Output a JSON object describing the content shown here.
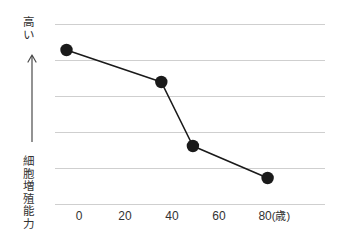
{
  "chart_data": {
    "type": "line",
    "title": "",
    "subtitle": "",
    "xlabel": "年齢",
    "ylabel": "細胞増殖能力",
    "x_unit": "（歳）",
    "y_axis_top_label": "高い",
    "y_axis_arrow": "up-arrow",
    "xlim": [
      -4,
      90
    ],
    "ylim": [
      0,
      6
    ],
    "xticks": [
      0,
      20,
      40,
      60,
      80
    ],
    "xticklabels": [
      "0",
      "20",
      "40",
      "60",
      "80"
    ],
    "xticklabel_last_suffix": "(歳)",
    "yticks": [
      0,
      1,
      2,
      3,
      4,
      5
    ],
    "yticklabels": [
      "",
      "",
      "",
      "",
      "",
      ""
    ],
    "grid": "horizontal",
    "legend": "none",
    "marker": "filled-circle",
    "series": [
      {
        "name": "細胞増殖能力",
        "x": [
          0,
          33,
          44,
          70
        ],
        "y": [
          5.0,
          4.0,
          2.0,
          1.0
        ],
        "color": "#1a1a1a"
      }
    ],
    "colors": {
      "line": "#1a1a1a",
      "marker": "#1a1a1a",
      "gridline": "#cfcfcf",
      "text": "#333333",
      "background": "#ffffff"
    }
  },
  "axes": {
    "y_caption_high": "高い",
    "y_caption_metric": "細胞増殖能力",
    "x_labels": [
      {
        "text": "0",
        "unit": ""
      },
      {
        "text": "20",
        "unit": ""
      },
      {
        "text": "40",
        "unit": ""
      },
      {
        "text": "60",
        "unit": ""
      },
      {
        "text": "80",
        "unit": "(歳)"
      }
    ]
  }
}
